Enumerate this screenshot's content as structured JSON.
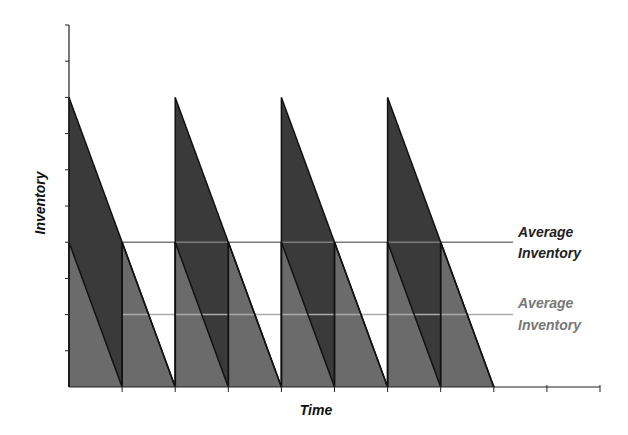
{
  "chart_data": {
    "type": "area",
    "title": "",
    "xlabel": "Time",
    "ylabel": "Inventory",
    "ylim": [
      0,
      10
    ],
    "y_ticks": [
      0,
      1,
      2,
      3,
      4,
      5,
      6,
      7,
      8,
      9,
      10
    ],
    "x_ticks": [
      0,
      1,
      2,
      3,
      4,
      5,
      6,
      7,
      8,
      9,
      10
    ],
    "grid": false,
    "series": [
      {
        "name": "Larger order quantity (sawtooth)",
        "color": "#3a3a3a",
        "order_quantity": 8,
        "cycle_length": 2,
        "cycles": 4,
        "cycle_starts": [
          0,
          2,
          4,
          6
        ],
        "average_inventory": 4
      },
      {
        "name": "Smaller order quantity (sawtooth)",
        "color": "#6b6b6b",
        "order_quantity": 4,
        "cycle_length": 1,
        "cycles": 8,
        "cycle_starts": [
          0,
          1,
          2,
          3,
          4,
          5,
          6,
          7
        ],
        "average_inventory": 2
      }
    ],
    "annotations": [
      {
        "text_lines": [
          "Average",
          "Inventory"
        ],
        "y": 4,
        "color": "#222222",
        "line_color": "#7a7a7a"
      },
      {
        "text_lines": [
          "Average",
          "Inventory"
        ],
        "y": 2,
        "color": "#777777",
        "line_color": "#aaaaaa"
      }
    ]
  },
  "labels": {
    "xlabel": "Time",
    "ylabel": "Inventory",
    "avg_dark_line1": "Average",
    "avg_dark_line2": "Inventory",
    "avg_light_line1": "Average",
    "avg_light_line2": "Inventory"
  },
  "colors": {
    "dark_fill": "#3a3a3a",
    "medium_fill": "#6b6b6b",
    "axis": "#222222",
    "avg_dark_line": "#7a7a7a",
    "avg_light_line": "#aaaaaa",
    "avg_dark_text": "#222222",
    "avg_light_text": "#777777"
  }
}
